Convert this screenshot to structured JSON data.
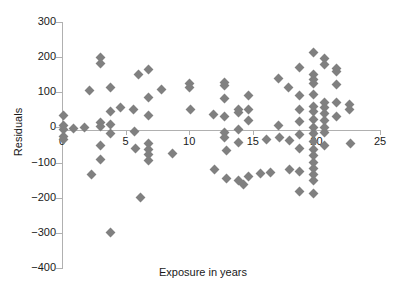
{
  "chart_data": {
    "type": "scatter",
    "title": "",
    "xlabel": "Exposure in years",
    "ylabel": "Residuals",
    "xlim": [
      0,
      25
    ],
    "ylim": [
      -400,
      300
    ],
    "xticks": [
      0,
      5,
      10,
      15,
      20,
      25
    ],
    "yticks": [
      300,
      200,
      100,
      0,
      -100,
      -200,
      -300,
      -400
    ],
    "xtick_labels": [
      "0",
      "5",
      "10",
      "15",
      "20",
      "25"
    ],
    "ytick_labels": [
      "300",
      "200",
      "100",
      "0",
      "−100",
      "−200",
      "−300",
      "−400"
    ],
    "grid": false,
    "legend": null,
    "marker": {
      "shape": "diamond",
      "color": "#808080",
      "size": 7
    },
    "axis_color": "#b0b0b0",
    "background": "#ffffff",
    "series": [
      {
        "name": "residuals",
        "points": [
          [
            0.1,
            35
          ],
          [
            0.1,
            5
          ],
          [
            0.1,
            -5
          ],
          [
            0.1,
            -25
          ],
          [
            0.1,
            -35
          ],
          [
            0.9,
            -3
          ],
          [
            1.8,
            0
          ],
          [
            2.2,
            104
          ],
          [
            2.3,
            -135
          ],
          [
            3.0,
            198
          ],
          [
            3.0,
            182
          ],
          [
            3.0,
            14
          ],
          [
            3.0,
            2
          ],
          [
            3.0,
            -52
          ],
          [
            3.0,
            -92
          ],
          [
            3.8,
            113
          ],
          [
            3.8,
            44
          ],
          [
            3.8,
            8
          ],
          [
            3.8,
            -18
          ],
          [
            3.8,
            -300
          ],
          [
            4.6,
            58
          ],
          [
            5.6,
            52
          ],
          [
            5.7,
            -12
          ],
          [
            5.8,
            -60
          ],
          [
            6.0,
            152
          ],
          [
            6.2,
            -199
          ],
          [
            6.8,
            166
          ],
          [
            6.8,
            85
          ],
          [
            6.8,
            34
          ],
          [
            6.8,
            -46
          ],
          [
            6.8,
            -62
          ],
          [
            6.8,
            -78
          ],
          [
            6.8,
            -95
          ],
          [
            7.8,
            109
          ],
          [
            8.7,
            -75
          ],
          [
            10.0,
            124
          ],
          [
            10.0,
            115
          ],
          [
            10.1,
            50
          ],
          [
            11.9,
            37
          ],
          [
            12.0,
            -120
          ],
          [
            12.8,
            128
          ],
          [
            12.8,
            118
          ],
          [
            12.8,
            82
          ],
          [
            12.8,
            30
          ],
          [
            12.8,
            -14
          ],
          [
            12.8,
            -28
          ],
          [
            12.9,
            -66
          ],
          [
            12.9,
            -146
          ],
          [
            13.9,
            52
          ],
          [
            13.9,
            42
          ],
          [
            13.9,
            -6
          ],
          [
            13.9,
            -44
          ],
          [
            13.9,
            -150
          ],
          [
            14.3,
            -162
          ],
          [
            14.7,
            91
          ],
          [
            14.7,
            50
          ],
          [
            14.7,
            20
          ],
          [
            14.7,
            -140
          ],
          [
            15.6,
            -130
          ],
          [
            16.1,
            -34
          ],
          [
            16.4,
            -127
          ],
          [
            17.0,
            139
          ],
          [
            17.0,
            6
          ],
          [
            17.1,
            -30
          ],
          [
            17.8,
            114
          ],
          [
            17.9,
            -36
          ],
          [
            17.9,
            -120
          ],
          [
            18.7,
            170
          ],
          [
            18.7,
            90
          ],
          [
            18.7,
            52
          ],
          [
            18.7,
            18
          ],
          [
            18.7,
            -20
          ],
          [
            18.7,
            -60
          ],
          [
            18.7,
            -124
          ],
          [
            18.7,
            -181
          ],
          [
            19.8,
            214
          ],
          [
            19.8,
            152
          ],
          [
            19.8,
            136
          ],
          [
            19.8,
            126
          ],
          [
            19.8,
            93
          ],
          [
            19.8,
            60
          ],
          [
            19.8,
            44
          ],
          [
            19.8,
            22
          ],
          [
            19.8,
            0
          ],
          [
            19.8,
            -18
          ],
          [
            19.8,
            -40
          ],
          [
            19.8,
            -62
          ],
          [
            19.8,
            -80
          ],
          [
            19.8,
            -100
          ],
          [
            19.8,
            -118
          ],
          [
            19.8,
            -134
          ],
          [
            19.8,
            -152
          ],
          [
            19.8,
            -188
          ],
          [
            20.6,
            196
          ],
          [
            20.6,
            180
          ],
          [
            20.6,
            72
          ],
          [
            20.6,
            58
          ],
          [
            20.6,
            40
          ],
          [
            20.6,
            20
          ],
          [
            20.6,
            0
          ],
          [
            20.6,
            -14
          ],
          [
            20.6,
            -50
          ],
          [
            21.6,
            168
          ],
          [
            21.6,
            158
          ],
          [
            21.6,
            122
          ],
          [
            21.6,
            70
          ],
          [
            21.6,
            32
          ],
          [
            22.6,
            64
          ],
          [
            22.6,
            52
          ],
          [
            22.7,
            -46
          ]
        ]
      }
    ]
  }
}
